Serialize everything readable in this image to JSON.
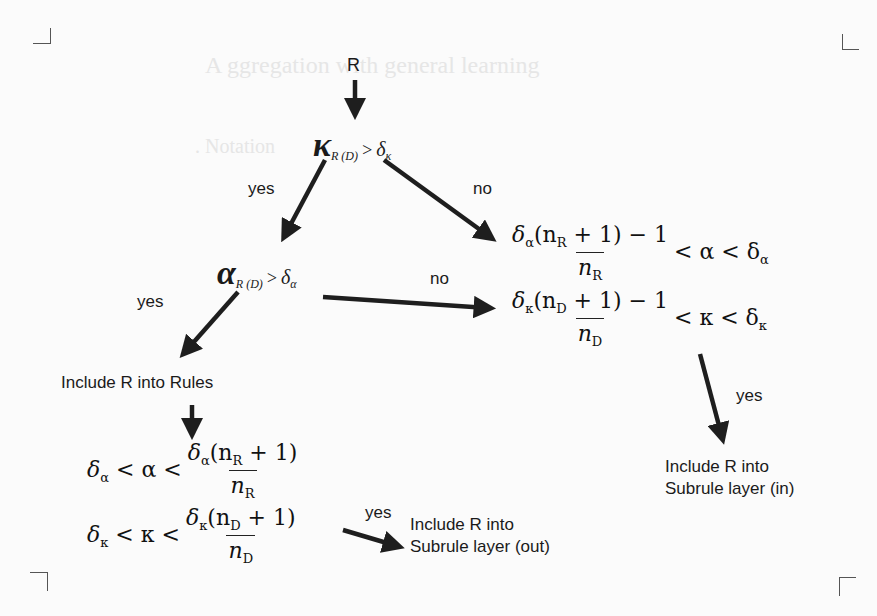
{
  "diagram": {
    "type": "decision-flowchart",
    "start_node": {
      "label": "R"
    },
    "decision_kappa": {
      "symbol": "κ",
      "subscript": "R (D)",
      "relation": ">",
      "threshold": "δ",
      "threshold_sub": "κ",
      "yes_label": "yes",
      "no_label": "no"
    },
    "decision_alpha": {
      "symbol": "α",
      "subscript": "R (D)",
      "relation": ">",
      "threshold": "δ",
      "threshold_sub": "α",
      "yes_label": "yes",
      "no_label": "no"
    },
    "no_branch_conditions": {
      "alpha": {
        "numerator": "δα(nR + 1) − 1",
        "num_parts": [
          "δ",
          "α",
          "(n",
          "R",
          " + 1) − 1"
        ],
        "denominator": [
          "n",
          "R"
        ],
        "tail": "< α < δα",
        "tail_parts": [
          "< α < δ",
          "α"
        ]
      },
      "kappa": {
        "numerator": "δκ(nD + 1) − 1",
        "num_parts": [
          "δ",
          "κ",
          "(n",
          "D",
          " + 1) − 1"
        ],
        "denominator": [
          "n",
          "D"
        ],
        "tail": "< κ < δκ",
        "tail_parts": [
          "< κ < δ",
          "κ"
        ]
      },
      "yes_label": "yes"
    },
    "include_rules": {
      "label": "Include R into Rules"
    },
    "yes_branch_conditions": {
      "alpha": {
        "head": "δα < α <",
        "head_parts": [
          "δ",
          "α",
          " < α <"
        ],
        "numerator": "δα(nR + 1)",
        "num_parts": [
          "δ",
          "α",
          "(n",
          "R",
          " + 1)"
        ],
        "denominator": [
          "n",
          "R"
        ]
      },
      "kappa": {
        "head": "δκ < κ <",
        "head_parts": [
          "δ",
          "κ",
          " < κ <"
        ],
        "numerator": "δκ(nD + 1)",
        "num_parts": [
          "δ",
          "κ",
          "(n",
          "D",
          " + 1)"
        ],
        "denominator": [
          "n",
          "D"
        ]
      },
      "yes_label": "yes"
    },
    "outcome_in": {
      "line1": "Include R into",
      "line2": "Subrule layer (in)"
    },
    "outcome_out": {
      "line1": "Include R into",
      "line2": "Subrule layer (out)"
    }
  },
  "colors": {
    "ink": "#1a1a1a",
    "paper": "#fbfbfb",
    "arrow": "#1e1e1e"
  }
}
